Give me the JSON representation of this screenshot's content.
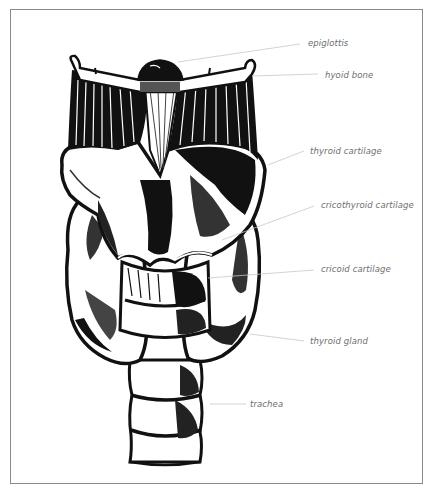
{
  "figure": {
    "frame_color": "#8a8a8a",
    "ink_color": "#111111",
    "label_color": "#6e6e6e",
    "leader_color": "#c8c8c8"
  },
  "labels": [
    {
      "id": "epiglottis",
      "text": "epiglottis",
      "x": 308,
      "y": 38,
      "leader": [
        178,
        62,
        300,
        44
      ]
    },
    {
      "id": "hyoid-bone",
      "text": "hyoid bone",
      "x": 325,
      "y": 70,
      "leader": [
        252,
        76,
        318,
        74
      ]
    },
    {
      "id": "thyroid-cartilage",
      "text": "thyroid cartilage",
      "x": 310,
      "y": 146,
      "leader": [
        268,
        165,
        304,
        151
      ]
    },
    {
      "id": "cricothyroid-cartilage",
      "text": "cricothyroid cartilage",
      "x": 321,
      "y": 200,
      "leader": [
        222,
        240,
        314,
        206
      ]
    },
    {
      "id": "cricoid-cartilage",
      "text": "cricoid cartilage",
      "x": 321,
      "y": 264,
      "leader": [
        208,
        278,
        314,
        270
      ]
    },
    {
      "id": "thyroid-gland",
      "text": "thyroid gland",
      "x": 310,
      "y": 336,
      "leader": [
        250,
        334,
        304,
        341
      ]
    },
    {
      "id": "trachea",
      "text": "trachea",
      "x": 250,
      "y": 399,
      "leader": [
        210,
        404,
        246,
        404
      ]
    }
  ]
}
